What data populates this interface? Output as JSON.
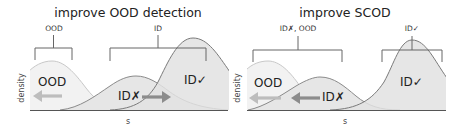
{
  "colors": {
    "background": "#ffffff",
    "text": "#222222",
    "ood_fill": "#f2f2f2",
    "ood_stroke": "#c8c8c8",
    "idx_fill": "#e6e6e6",
    "idx_stroke": "#8a8a8a",
    "idc_fill": "#e2e2e2",
    "idc_stroke": "#7a7a7a",
    "bracket": "#666666",
    "arrow_light": "#bdbdbd",
    "arrow_dark": "#8c8c8c",
    "baseline": "#555555"
  },
  "panels": [
    {
      "title": "improve OOD detection",
      "ylabel": "density",
      "xlabel": "s",
      "curve_labels": {
        "ood": "OOD",
        "id_wrong": "ID✗",
        "id_correct": "ID✓"
      },
      "brackets": [
        {
          "label": "OOD",
          "x1": 35,
          "x2": 72
        },
        {
          "label": "ID",
          "x1": 110,
          "x2": 206
        }
      ],
      "arrows": [
        {
          "style": "light",
          "direction": "left"
        },
        {
          "style": "dark",
          "direction": "right"
        }
      ]
    },
    {
      "title": "improve SCOD",
      "ylabel": "density",
      "xlabel": "s",
      "curve_labels": {
        "ood": "OOD",
        "id_wrong": "ID✗",
        "id_correct": "ID✓"
      },
      "brackets": [
        {
          "label": "ID✗, OOD",
          "x1": 253,
          "x2": 342
        },
        {
          "label": "ID✓",
          "x1": 382,
          "x2": 442
        }
      ],
      "arrows": [
        {
          "style": "light",
          "direction": "left"
        },
        {
          "style": "dark",
          "direction": "left"
        }
      ]
    }
  ]
}
